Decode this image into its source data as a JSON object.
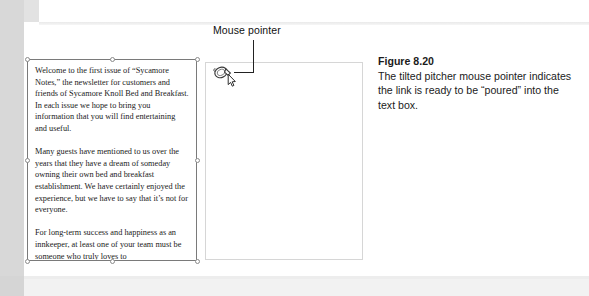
{
  "figure": {
    "callout_label": "Mouse pointer",
    "caption_title": "Figure 8.20",
    "caption_body": "The tilted pitcher mouse pointer indicates the link is ready to be “poured” into the text box.",
    "pointer_icon": "tilted-pitcher-pointer-icon"
  },
  "document": {
    "text_box": {
      "paragraphs": [
        "Welcome to the first issue of “Sycamore Notes,” the newsletter for customers and friends of Sycamore Knoll Bed and Breakfast.  In each issue we hope to bring you information that you will find entertaining and useful.",
        "Many guests have mentioned to us over the years that they have a dream of someday owning their own bed and breakfast establishment. We have certainly enjoyed the experience, but we have to say that it’s not for everyone.",
        "For long-term success and happiness as an innkeeper, at least one of your team must be someone who truly loves to"
      ]
    },
    "empty_text_box": {
      "content": ""
    }
  },
  "colors": {
    "selection_border": "#7a7a7a",
    "empty_box_border": "#d6d6d6",
    "leader_line": "#222222",
    "scan_edge": "#d8d8d8"
  }
}
